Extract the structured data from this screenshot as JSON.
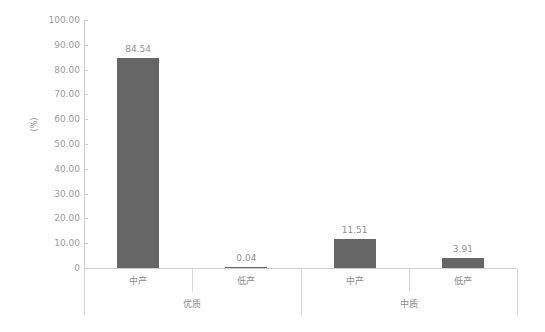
{
  "chart_data": {
    "type": "bar",
    "title": "",
    "xlabel": "",
    "ylabel": "(%)",
    "ylim": [
      0,
      100
    ],
    "ytick_step": 10,
    "grid": false,
    "legend": "none",
    "bar_color": "#666666",
    "axis_color": "#cccccc",
    "text_color": "#8a8a8a",
    "groups": [
      {
        "label": "优质",
        "categories": [
          "中产",
          "低产"
        ],
        "values": [
          84.54,
          0.04
        ],
        "value_labels": [
          "84.54",
          "0.04"
        ]
      },
      {
        "label": "中质",
        "categories": [
          "中产",
          "低产"
        ],
        "values": [
          11.51,
          3.91
        ],
        "value_labels": [
          "11.51",
          "3.91"
        ]
      }
    ],
    "categories": [
      "中产",
      "低产",
      "中产",
      "低产"
    ],
    "values": [
      84.54,
      0.04,
      11.51,
      3.91
    ],
    "ytick_labels": [
      "100.00",
      "90.00",
      "80.00",
      "70.00",
      "60.00",
      "50.00",
      "40.00",
      "30.00",
      "20.00",
      "10.00",
      "0"
    ],
    "ytick_values": [
      100,
      90,
      80,
      70,
      60,
      50,
      40,
      30,
      20,
      10,
      0
    ]
  },
  "axis": {
    "y_label": "(%)"
  }
}
